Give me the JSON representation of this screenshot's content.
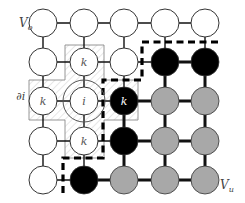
{
  "diagram": {
    "title": "",
    "labels": {
      "top_left": {
        "main": "V",
        "sub": "o"
      },
      "bottom_right": {
        "main": "V",
        "sub": "u"
      },
      "neighborhood": "∂i",
      "center": "i",
      "neighbor": "k"
    },
    "grid": {
      "cols_x": [
        43,
        84,
        124,
        165,
        205
      ],
      "rows_y": [
        23,
        62,
        101,
        141,
        180
      ],
      "node_radius": 14
    },
    "node_states": [
      [
        "white",
        "white",
        "white",
        "white",
        "white"
      ],
      [
        "white",
        "white",
        "white",
        "black",
        "black"
      ],
      [
        "white",
        "white",
        "black",
        "gray",
        "gray"
      ],
      [
        "white",
        "white",
        "black",
        "gray",
        "gray"
      ],
      [
        "white",
        "black",
        "gray",
        "gray",
        "gray"
      ]
    ],
    "node_labels": [
      [
        "",
        "",
        "",
        "",
        ""
      ],
      [
        "",
        "k",
        "",
        "",
        ""
      ],
      [
        "k",
        "i",
        "k",
        "",
        ""
      ],
      [
        "",
        "k",
        "",
        "",
        ""
      ],
      [
        "",
        "",
        "",
        "",
        ""
      ]
    ],
    "colors": {
      "white_node": "#ffffff",
      "black_node": "#000000",
      "gray_node": "#a8a8a8",
      "stroke": "#222222",
      "hatch": "#cccccc",
      "box": "#888888"
    }
  }
}
